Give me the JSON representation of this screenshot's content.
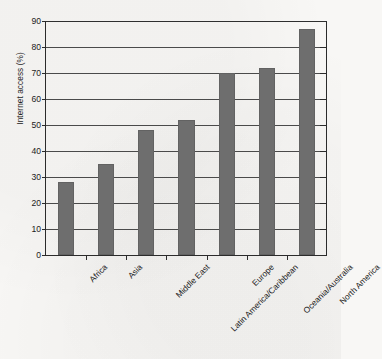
{
  "chart_data": {
    "type": "bar",
    "title": "",
    "subtitle": "",
    "xlabel": "",
    "ylabel": "Internet access (%)",
    "categories": [
      "Africa",
      "Asia",
      "Middle East",
      "Latin America/Caribbean",
      "Europe",
      "Oceania/Australia",
      "North America"
    ],
    "values": [
      28,
      35,
      48,
      52,
      70,
      72,
      87
    ],
    "series": [
      {
        "name": "Internet access (%)",
        "values": [
          28,
          35,
          48,
          52,
          70,
          72,
          87
        ]
      }
    ],
    "ylim": [
      0,
      90
    ],
    "ytick_step": 10,
    "yticks": [
      0,
      10,
      20,
      30,
      40,
      50,
      60,
      70,
      80,
      90
    ],
    "ytick_labels": [
      "0",
      "10",
      "20",
      "30",
      "40",
      "50",
      "60",
      "70",
      "80",
      "90"
    ],
    "grid": "horizontal",
    "legend": "none",
    "bar_color": "#6e6e6e",
    "axis_color": "#2b2b2b",
    "gridline_color": "#4a4a4a",
    "background_color": "#f8f7f5",
    "xtick_label_rotation": "-45"
  }
}
